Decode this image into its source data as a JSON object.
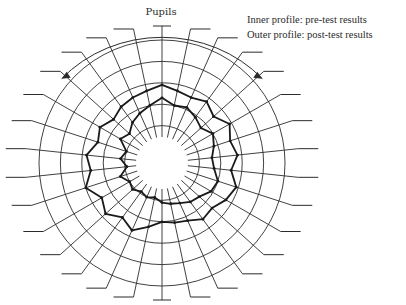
{
  "chart_data": {
    "type": "radar",
    "title": "Pupils",
    "legend": [
      "Inner profile: pre-test results",
      "Outer profile: post-test results"
    ],
    "legend_position": "top-right",
    "num_axes": 30,
    "axis_labels": [],
    "rings": [
      1,
      2,
      3,
      4,
      5
    ],
    "range": [
      0,
      5
    ],
    "series": [
      {
        "name": "Pre-test (inner profile)",
        "values": [
          2.3,
          2.0,
          2.1,
          1.9,
          1.7,
          2.0,
          1.8,
          1.6,
          1.7,
          2.0,
          1.9,
          1.6,
          1.5,
          1.3,
          1.2,
          1.1,
          0.9,
          1.0,
          0.9,
          1.1,
          1.0,
          1.3,
          0.9,
          1.2,
          1.0,
          1.5,
          1.3,
          1.6,
          1.8,
          2.0
        ]
      },
      {
        "name": "Post-test (outer profile)",
        "values": [
          2.9,
          2.7,
          2.6,
          2.8,
          2.5,
          2.9,
          2.6,
          2.8,
          2.5,
          2.9,
          2.7,
          2.4,
          2.5,
          2.2,
          2.1,
          2.0,
          2.3,
          2.7,
          2.4,
          2.8,
          2.5,
          3.0,
          2.6,
          2.8,
          2.4,
          2.6,
          2.3,
          2.5,
          2.6,
          2.7
        ]
      }
    ]
  }
}
